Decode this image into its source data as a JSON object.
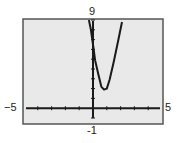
{
  "chart_data": {
    "type": "line",
    "title": "",
    "xlabel": "",
    "ylabel": "",
    "xlim": [
      -5,
      5
    ],
    "ylim": [
      -1,
      9
    ],
    "xscale": 1,
    "yscale": 1,
    "grid": false,
    "window_labels": {
      "ymax": "9",
      "ymin": "-1",
      "xmin": "−5",
      "xmax": "5"
    },
    "series": [
      {
        "name": "curve",
        "points": [
          [
            -0.3,
            9
          ],
          [
            -0.15,
            8
          ],
          [
            0.0,
            6.5
          ],
          [
            0.15,
            4.9
          ],
          [
            0.4,
            3.4
          ],
          [
            0.6,
            2.2
          ],
          [
            0.8,
            1.9
          ],
          [
            1.0,
            2.0
          ],
          [
            1.2,
            2.9
          ],
          [
            1.5,
            4.7
          ],
          [
            1.8,
            6.7
          ],
          [
            2.1,
            8.8
          ]
        ]
      }
    ]
  },
  "colors": {
    "screen": "#e9e9e9",
    "frame": "#555555",
    "curve": "#1a1a1a",
    "axis": "#1a1a1a"
  }
}
